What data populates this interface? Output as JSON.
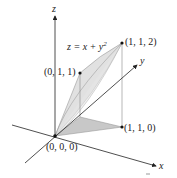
{
  "diagram": {
    "equation": {
      "prefix": "z = x + y",
      "exponent": "2"
    },
    "axes": {
      "x": "x",
      "y": "y",
      "z": "z"
    },
    "points": [
      {
        "id": "origin",
        "label": "(0, 0, 0)"
      },
      {
        "id": "p011",
        "label": "(0, 1, 1)"
      },
      {
        "id": "p112",
        "label": "(1, 1, 2)"
      },
      {
        "id": "p110",
        "label": "(1, 1, 0)"
      }
    ],
    "colors": {
      "axis": "#222222",
      "surface_fill": "#d9d9d9",
      "surface_edge": "#9a9a9a",
      "base_fill": "#c8c8c8"
    }
  }
}
